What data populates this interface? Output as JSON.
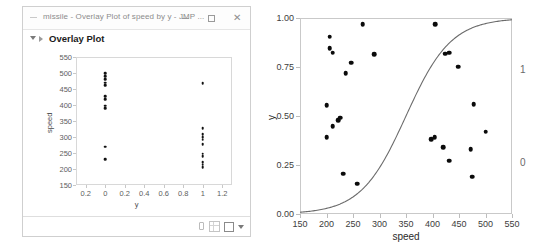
{
  "window": {
    "title": "missile - Overlay Plot of speed by y - JMP ...",
    "app_icon": "document-icon",
    "controls": {
      "minimize": "minimize-icon",
      "maximize": "maximize-icon",
      "close": "close-icon"
    },
    "panel": {
      "disclosure": "disclosure-triangle-icon",
      "marker": "red-triangle-icon",
      "heading": "Overlay Plot"
    },
    "statusbar": {
      "icons": [
        "hand-tool-icon",
        "grid-icon",
        "square-icon",
        "caret-down-icon"
      ]
    }
  },
  "chart_data": [
    {
      "id": "overlay-plot",
      "type": "scatter",
      "title": "Overlay Plot",
      "xlabel": "y",
      "ylabel": "speed",
      "xlim": [
        -0.3,
        1.3
      ],
      "ylim": [
        150,
        550
      ],
      "xticks": [
        -0.2,
        0,
        0.2,
        0.4,
        0.6,
        0.8,
        1,
        1.2
      ],
      "xtick_labels": [
        "0.2",
        "0",
        "0.2",
        "0.4",
        "0.6",
        "0.8",
        "1",
        "1.2"
      ],
      "yticks": [
        150,
        200,
        250,
        300,
        350,
        400,
        450,
        500,
        550
      ],
      "ytick_labels": [
        "150",
        "200",
        "250",
        "300",
        "350",
        "400",
        "450",
        "500",
        "550"
      ],
      "grid": false,
      "legend": "none",
      "points": [
        {
          "x": 0,
          "y": 500
        },
        {
          "x": 0,
          "y": 490
        },
        {
          "x": 0,
          "y": 480
        },
        {
          "x": 0,
          "y": 470
        },
        {
          "x": 0,
          "y": 462
        },
        {
          "x": 0,
          "y": 428
        },
        {
          "x": 0,
          "y": 418
        },
        {
          "x": 0,
          "y": 398
        },
        {
          "x": 0,
          "y": 390
        },
        {
          "x": 0,
          "y": 270
        },
        {
          "x": 0,
          "y": 231
        },
        {
          "x": 1,
          "y": 468
        },
        {
          "x": 1,
          "y": 328
        },
        {
          "x": 1,
          "y": 308
        },
        {
          "x": 1,
          "y": 300
        },
        {
          "x": 1,
          "y": 292
        },
        {
          "x": 1,
          "y": 277
        },
        {
          "x": 1,
          "y": 248
        },
        {
          "x": 1,
          "y": 240
        },
        {
          "x": 1,
          "y": 222
        },
        {
          "x": 1,
          "y": 214
        },
        {
          "x": 1,
          "y": 206
        }
      ]
    },
    {
      "id": "logistic-plot",
      "type": "scatter",
      "title": "",
      "xlabel": "speed",
      "ylabel": "y",
      "xlim": [
        150,
        550
      ],
      "ylim": [
        0.0,
        1.0
      ],
      "xticks": [
        150,
        200,
        250,
        300,
        350,
        400,
        450,
        500,
        550
      ],
      "xtick_labels": [
        "150",
        "200",
        "250",
        "300",
        "350",
        "400",
        "450",
        "500",
        "550"
      ],
      "yticks": [
        0.0,
        0.25,
        0.5,
        0.75,
        1.0
      ],
      "ytick_labels": [
        "0.00",
        "0.25",
        "0.50",
        "0.75",
        "1.00"
      ],
      "secondary_axis_labels": [
        {
          "label": "1",
          "y": 0.74
        },
        {
          "label": "0",
          "y": 0.265
        }
      ],
      "grid": false,
      "legend": "none",
      "curve": {
        "name": "logistic fit",
        "color": "#6b6b6b",
        "x0": 350,
        "k": 0.0235,
        "x_start": 150,
        "x_end": 550
      },
      "points": [
        {
          "x": 206,
          "y": 0.905
        },
        {
          "x": 206,
          "y": 0.845
        },
        {
          "x": 212,
          "y": 0.823
        },
        {
          "x": 268,
          "y": 0.968
        },
        {
          "x": 247,
          "y": 0.772
        },
        {
          "x": 236,
          "y": 0.718
        },
        {
          "x": 290,
          "y": 0.815
        },
        {
          "x": 200,
          "y": 0.555
        },
        {
          "x": 222,
          "y": 0.478
        },
        {
          "x": 226,
          "y": 0.492
        },
        {
          "x": 212,
          "y": 0.447
        },
        {
          "x": 200,
          "y": 0.392
        },
        {
          "x": 231,
          "y": 0.205
        },
        {
          "x": 258,
          "y": 0.155
        },
        {
          "x": 405,
          "y": 0.968
        },
        {
          "x": 424,
          "y": 0.818
        },
        {
          "x": 431,
          "y": 0.822
        },
        {
          "x": 448,
          "y": 0.752
        },
        {
          "x": 478,
          "y": 0.56
        },
        {
          "x": 398,
          "y": 0.383
        },
        {
          "x": 404,
          "y": 0.393
        },
        {
          "x": 420,
          "y": 0.342
        },
        {
          "x": 432,
          "y": 0.272
        },
        {
          "x": 472,
          "y": 0.33
        },
        {
          "x": 475,
          "y": 0.19
        },
        {
          "x": 500,
          "y": 0.42
        }
      ]
    }
  ]
}
